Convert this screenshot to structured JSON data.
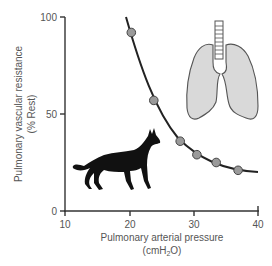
{
  "chart_data": {
    "type": "line",
    "title": "",
    "xlabel": "Pulmonary arterial pressure",
    "xlabel_unit": "(cmH2O)",
    "ylabel": "Pulmonary vascular resistance",
    "ylabel_unit": "(% Rest)",
    "xlim": [
      10,
      40
    ],
    "ylim": [
      0,
      100
    ],
    "x_ticks": [
      10,
      20,
      30,
      40
    ],
    "y_ticks": [
      0,
      50,
      100
    ],
    "grid": false,
    "legend": null,
    "series": [
      {
        "name": "Pulmonary vascular resistance",
        "marker": "circle",
        "marker_color": "#9a9a9a",
        "line_color": "#222222",
        "x": [
          20.3,
          23.8,
          27.9,
          30.5,
          33.5,
          36.9
        ],
        "y": [
          92,
          57,
          36,
          29,
          25,
          21
        ]
      }
    ],
    "curve_extent": {
      "x_start": 19.5,
      "y_start": 100,
      "x_end": 39.8,
      "y_end": 20
    },
    "annotations": [
      {
        "type": "icon",
        "name": "dog-silhouette"
      },
      {
        "type": "icon",
        "name": "lungs-illustration"
      }
    ]
  },
  "axes": {
    "x_tick_labels": [
      "10",
      "20",
      "30",
      "40"
    ],
    "y_tick_labels": [
      "0",
      "50",
      "100"
    ],
    "x_title_line1": "Pulmonary arterial pressure",
    "x_title_line2_prefix": "(cmH",
    "x_title_line2_sub": "2",
    "x_title_line2_suffix": "O)",
    "y_title_line1": "Pulmonary vascular resistance",
    "y_title_line2": "(% Rest)"
  },
  "colors": {
    "axis": "#333333",
    "curve": "#222222",
    "marker_fill": "#9a9a9a",
    "marker_stroke": "#444444",
    "lung_fill": "#d9d9d9",
    "lung_stroke": "#555555",
    "dog_fill": "#111111"
  }
}
